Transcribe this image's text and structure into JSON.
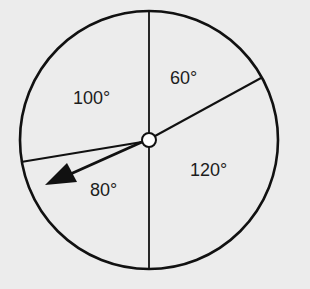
{
  "diagram": {
    "type": "spinner",
    "sectors": [
      {
        "label": "60°",
        "degrees": 60,
        "position": "upper-right"
      },
      {
        "label": "120°",
        "degrees": 120,
        "position": "lower-right"
      },
      {
        "label": "80°",
        "degrees": 80,
        "position": "lower-left"
      },
      {
        "label": "100°",
        "degrees": 100,
        "position": "upper-left"
      }
    ],
    "arrow_points_to": "80°",
    "colors": {
      "line": "#111111",
      "background": "#ececec",
      "hub_fill": "#ffffff"
    }
  }
}
